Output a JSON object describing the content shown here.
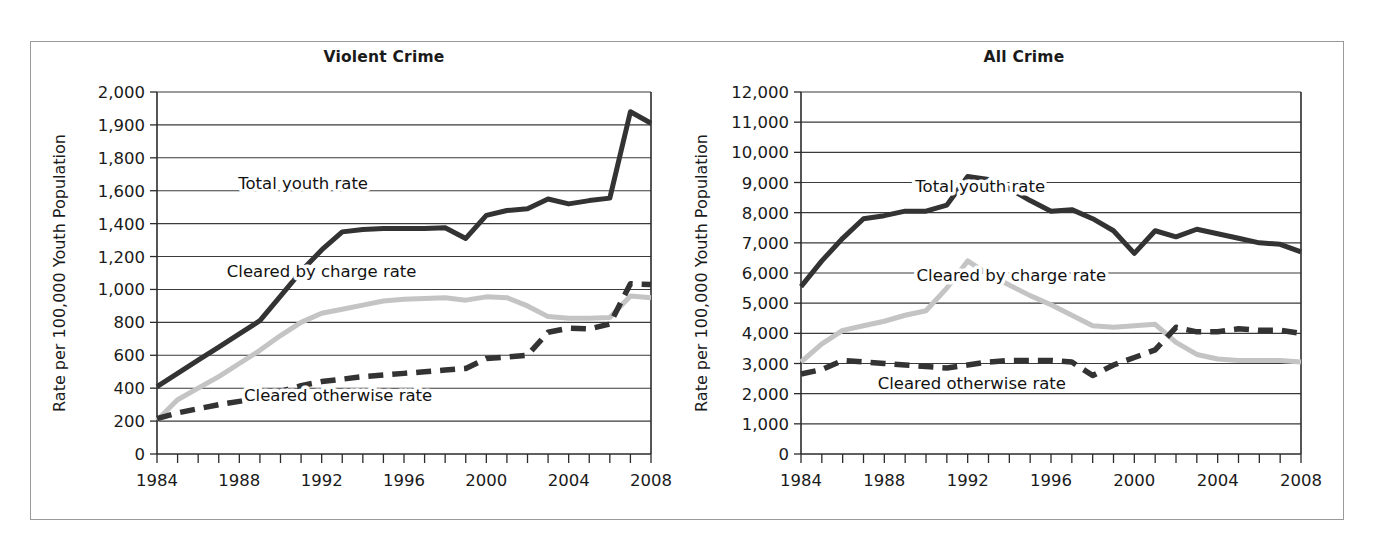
{
  "figure": {
    "background": "#ffffff",
    "frame_color": "#9a9a9a"
  },
  "colors": {
    "total": "#333333",
    "charge": "#c4c4c4",
    "otherwise": "#333333",
    "axis": "#2b2b2b",
    "grid": "#3a3a3a",
    "text": "#1a1a1a"
  },
  "chart_data": [
    {
      "type": "line",
      "title": "Violent Crime",
      "xlabel": "",
      "ylabel": "Rate per 100,000 Youth Population",
      "x": [
        1984,
        1985,
        1986,
        1987,
        1988,
        1989,
        1990,
        1991,
        1992,
        1993,
        1994,
        1995,
        1996,
        1997,
        1998,
        1999,
        2000,
        2001,
        2002,
        2003,
        2004,
        2005,
        2006,
        2007,
        2008
      ],
      "xlim": [
        1984,
        2008
      ],
      "xticks": [
        1984,
        1985,
        1986,
        1987,
        1988,
        1989,
        1990,
        1991,
        1992,
        1993,
        1994,
        1995,
        1996,
        1997,
        1998,
        1999,
        2000,
        2001,
        2002,
        2003,
        2004,
        2005,
        2006,
        2007,
        2008
      ],
      "xticklabels": [
        "1984",
        "",
        "",
        "",
        "1988",
        "",
        "",
        "",
        "1992",
        "",
        "",
        "",
        "1996",
        "",
        "",
        "",
        "2000",
        "",
        "",
        "",
        "2004",
        "",
        "",
        "",
        "2008"
      ],
      "ytickvalues": [
        0,
        200,
        400,
        600,
        800,
        1000,
        1200,
        1400,
        1600,
        1800,
        1900,
        2000
      ],
      "yticklabels": [
        "0",
        "200",
        "400",
        "600",
        "800",
        "1,000",
        "1,200",
        "1,400",
        "1,600",
        "1,800",
        "1,900",
        "2,000"
      ],
      "y_axis_note": "tick positions evenly spaced; value steps are 200 up to 1,800 then 100",
      "grid": "horizontal",
      "legend": "inline-annotations",
      "series": [
        {
          "name": "Total youth rate",
          "style": "solid",
          "color": "#333333",
          "width": 5,
          "values": [
            410,
            490,
            570,
            650,
            730,
            810,
            960,
            1110,
            1240,
            1350,
            1365,
            1370,
            1370,
            1370,
            1375,
            1310,
            1450,
            1480,
            1490,
            1550,
            1520,
            1540,
            1555,
            1940,
            1905
          ]
        },
        {
          "name": "Cleared by charge rate",
          "style": "solid",
          "color": "#c4c4c4",
          "width": 5,
          "values": [
            205,
            330,
            400,
            470,
            550,
            630,
            720,
            800,
            855,
            880,
            905,
            930,
            940,
            945,
            950,
            935,
            955,
            950,
            900,
            835,
            825,
            825,
            830,
            960,
            950
          ]
        },
        {
          "name": "Cleared otherwise rate",
          "style": "dashed",
          "color": "#333333",
          "width": 5.5,
          "values": [
            215,
            250,
            275,
            300,
            320,
            340,
            380,
            415,
            440,
            455,
            470,
            480,
            490,
            500,
            510,
            520,
            580,
            590,
            600,
            740,
            765,
            760,
            790,
            1035,
            1030
          ]
        }
      ],
      "annotations": [
        {
          "text": "Total youth rate",
          "x": 1991.1,
          "y": 1610
        },
        {
          "text": "Cleared by charge rate",
          "x": 1992.0,
          "y": 1075
        },
        {
          "text": "Cleared otherwise rate",
          "x": 1992.8,
          "y": 325
        }
      ]
    },
    {
      "type": "line",
      "title": "All Crime",
      "xlabel": "",
      "ylabel": "Rate per 100,000 Youth Population",
      "x": [
        1984,
        1985,
        1986,
        1987,
        1988,
        1989,
        1990,
        1991,
        1992,
        1993,
        1994,
        1995,
        1996,
        1997,
        1998,
        1999,
        2000,
        2001,
        2002,
        2003,
        2004,
        2005,
        2006,
        2007,
        2008
      ],
      "xlim": [
        1984,
        2008
      ],
      "xticks": [
        1984,
        1985,
        1986,
        1987,
        1988,
        1989,
        1990,
        1991,
        1992,
        1993,
        1994,
        1995,
        1996,
        1997,
        1998,
        1999,
        2000,
        2001,
        2002,
        2003,
        2004,
        2005,
        2006,
        2007,
        2008
      ],
      "xticklabels": [
        "1984",
        "",
        "",
        "",
        "1988",
        "",
        "",
        "",
        "1992",
        "",
        "",
        "",
        "1996",
        "",
        "",
        "",
        "2000",
        "",
        "",
        "",
        "2004",
        "",
        "",
        "",
        "2008"
      ],
      "ytickvalues": [
        0,
        1000,
        2000,
        3000,
        4000,
        5000,
        6000,
        7000,
        8000,
        9000,
        10000,
        11000,
        12000
      ],
      "yticklabels": [
        "0",
        "1,000",
        "2,000",
        "3,000",
        "4,000",
        "5,000",
        "6,000",
        "7,000",
        "8,000",
        "9,000",
        "10,000",
        "11,000",
        "12,000"
      ],
      "y_axis_note": "evenly spaced ticks, 1,000 unit steps",
      "grid": "horizontal",
      "legend": "inline-annotations",
      "series": [
        {
          "name": "Total youth rate",
          "style": "solid",
          "color": "#333333",
          "width": 5,
          "values": [
            5550,
            6400,
            7150,
            7800,
            7900,
            8050,
            8050,
            8250,
            9200,
            9100,
            8800,
            8400,
            8050,
            8100,
            7800,
            7400,
            6650,
            7400,
            7200,
            7450,
            7300,
            7150,
            7000,
            6950,
            6700
          ]
        },
        {
          "name": "Cleared by charge rate",
          "style": "solid",
          "color": "#c4c4c4",
          "width": 5,
          "values": [
            3050,
            3650,
            4100,
            4250,
            4400,
            4600,
            4750,
            5500,
            6400,
            5950,
            5600,
            5250,
            4950,
            4600,
            4250,
            4200,
            4250,
            4300,
            3700,
            3300,
            3150,
            3100,
            3100,
            3100,
            3050
          ]
        },
        {
          "name": "Cleared otherwise rate",
          "style": "dashed",
          "color": "#333333",
          "width": 5.5,
          "values": [
            2650,
            2800,
            3100,
            3050,
            3000,
            2950,
            2900,
            2850,
            2950,
            3050,
            3100,
            3100,
            3100,
            3050,
            2600,
            2950,
            3200,
            3450,
            4200,
            4050,
            4050,
            4150,
            4100,
            4100,
            4000
          ]
        }
      ],
      "annotations": [
        {
          "text": "Total youth rate",
          "x": 1992.6,
          "y": 8700
        },
        {
          "text": "Cleared by charge rate",
          "x": 1994.1,
          "y": 5750
        },
        {
          "text": "Cleared otherwise rate",
          "x": 1992.2,
          "y": 2150
        }
      ]
    }
  ]
}
